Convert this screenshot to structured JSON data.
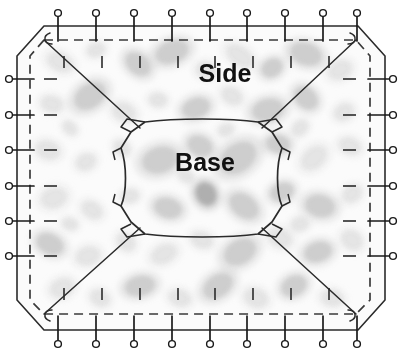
{
  "diagram": {
    "labels": {
      "side": "Side",
      "base": "Base"
    },
    "colors": {
      "outline": "#2b2b2b",
      "dashed_seam": "#3a3a3a",
      "pin_stroke": "#1a1a1a",
      "pin_fill": "#ffffff",
      "tick": "#2b2b2b",
      "fabric_base": "#fbfbfb",
      "fabric_blob_light": "#e2e2e2",
      "fabric_blob_mid": "#c9c9c9",
      "fabric_blob_dark": "#a8a8a8",
      "text": "#111111",
      "background": "#ffffff"
    },
    "geometry": {
      "outline_points": "44,26 358,26 385,56 385,300 358,330 44,330 17,300 17,56",
      "seam_points": "44,40 356,40 370,56 370,300 356,314 44,314 30,300 30,56",
      "base_path": "M145,122 C175,118 230,118 258,122 L272,132 L282,148 C276,165 276,192 282,206 L272,222 L258,234 C230,238 175,238 145,234 L131,222 L121,206 C127,192 127,165 121,148 L131,132 Z",
      "dart_lines": [
        "44,40 140,128",
        "356,40 262,128",
        "44,314 140,228",
        "356,314 262,228"
      ]
    },
    "pins": {
      "top": {
        "count": 9,
        "orientation": "vertical-down",
        "head_radius": 3.4,
        "y_head": 13,
        "y_tip": 41,
        "x_positions": [
          58,
          96,
          134,
          172,
          210,
          247,
          285,
          323,
          357
        ]
      },
      "bottom": {
        "count": 9,
        "orientation": "vertical-up",
        "head_radius": 3.4,
        "y_head": 344,
        "y_tip": 316,
        "x_positions": [
          58,
          96,
          134,
          172,
          210,
          247,
          285,
          323,
          357
        ]
      },
      "left": {
        "count": 6,
        "orientation": "horizontal-right",
        "head_radius": 3.4,
        "x_head": 9,
        "x_tip": 34,
        "y_positions": [
          79,
          115,
          150,
          186,
          221,
          256
        ]
      },
      "right": {
        "count": 6,
        "orientation": "horizontal-left",
        "head_radius": 3.4,
        "x_head": 393,
        "x_tip": 368,
        "y_positions": [
          79,
          115,
          150,
          186,
          221,
          256
        ]
      }
    },
    "ticks": {
      "top": {
        "count": 8,
        "x_positions": [
          64,
          102,
          140,
          178,
          215,
          253,
          291,
          329
        ],
        "y_start": 56,
        "y_end": 68
      },
      "bottom": {
        "count": 8,
        "x_positions": [
          64,
          102,
          140,
          178,
          215,
          253,
          291,
          329
        ],
        "y_start": 288,
        "y_end": 300
      },
      "left": {
        "count": 6,
        "y_positions": [
          79,
          115,
          150,
          186,
          221,
          256
        ],
        "x_start": 44,
        "x_end": 57
      },
      "right": {
        "count": 6,
        "y_positions": [
          79,
          115,
          150,
          186,
          221,
          256
        ],
        "x_start": 343,
        "x_end": 356
      }
    },
    "fabric_blobs": [
      {
        "cx": 60,
        "cy": 62,
        "rx": 13,
        "ry": 9,
        "rot": 24,
        "tone": "light"
      },
      {
        "cx": 96,
        "cy": 50,
        "rx": 9,
        "ry": 7,
        "rot": -15,
        "tone": "light"
      },
      {
        "cx": 138,
        "cy": 64,
        "rx": 14,
        "ry": 10,
        "rot": 40,
        "tone": "mid"
      },
      {
        "cx": 172,
        "cy": 52,
        "rx": 17,
        "ry": 11,
        "rot": -20,
        "tone": "mid"
      },
      {
        "cx": 206,
        "cy": 70,
        "rx": 10,
        "ry": 8,
        "rot": 10,
        "tone": "light"
      },
      {
        "cx": 240,
        "cy": 56,
        "rx": 15,
        "ry": 9,
        "rot": 35,
        "tone": "light"
      },
      {
        "cx": 272,
        "cy": 68,
        "rx": 11,
        "ry": 9,
        "rot": -30,
        "tone": "mid"
      },
      {
        "cx": 306,
        "cy": 54,
        "rx": 16,
        "ry": 11,
        "rot": 18,
        "tone": "mid"
      },
      {
        "cx": 340,
        "cy": 70,
        "rx": 12,
        "ry": 9,
        "rot": -25,
        "tone": "light"
      },
      {
        "cx": 52,
        "cy": 104,
        "rx": 11,
        "ry": 8,
        "rot": 12,
        "tone": "light"
      },
      {
        "cx": 90,
        "cy": 96,
        "rx": 17,
        "ry": 12,
        "rot": -35,
        "tone": "mid"
      },
      {
        "cx": 124,
        "cy": 112,
        "rx": 12,
        "ry": 9,
        "rot": 22,
        "tone": "light"
      },
      {
        "cx": 158,
        "cy": 100,
        "rx": 9,
        "ry": 7,
        "rot": 5,
        "tone": "light"
      },
      {
        "cx": 196,
        "cy": 108,
        "rx": 14,
        "ry": 10,
        "rot": -18,
        "tone": "mid"
      },
      {
        "cx": 232,
        "cy": 96,
        "rx": 11,
        "ry": 8,
        "rot": 30,
        "tone": "light"
      },
      {
        "cx": 268,
        "cy": 110,
        "rx": 16,
        "ry": 11,
        "rot": -12,
        "tone": "mid"
      },
      {
        "cx": 306,
        "cy": 98,
        "rx": 13,
        "ry": 10,
        "rot": 42,
        "tone": "mid"
      },
      {
        "cx": 344,
        "cy": 112,
        "rx": 10,
        "ry": 8,
        "rot": -28,
        "tone": "light"
      },
      {
        "cx": 48,
        "cy": 150,
        "rx": 12,
        "ry": 9,
        "rot": 16,
        "tone": "light"
      },
      {
        "cx": 86,
        "cy": 162,
        "rx": 10,
        "ry": 8,
        "rot": -22,
        "tone": "light"
      },
      {
        "cx": 122,
        "cy": 148,
        "rx": 9,
        "ry": 7,
        "rot": 38,
        "tone": "light"
      },
      {
        "cx": 160,
        "cy": 160,
        "rx": 18,
        "ry": 13,
        "rot": -15,
        "tone": "mid"
      },
      {
        "cx": 200,
        "cy": 146,
        "rx": 13,
        "ry": 10,
        "rot": 25,
        "tone": "mid"
      },
      {
        "cx": 238,
        "cy": 158,
        "rx": 20,
        "ry": 14,
        "rot": -35,
        "tone": "mid"
      },
      {
        "cx": 278,
        "cy": 144,
        "rx": 12,
        "ry": 9,
        "rot": 8,
        "tone": "mid"
      },
      {
        "cx": 314,
        "cy": 158,
        "rx": 14,
        "ry": 10,
        "rot": -40,
        "tone": "light"
      },
      {
        "cx": 350,
        "cy": 146,
        "rx": 11,
        "ry": 8,
        "rot": 20,
        "tone": "light"
      },
      {
        "cx": 54,
        "cy": 198,
        "rx": 13,
        "ry": 10,
        "rot": -18,
        "tone": "light"
      },
      {
        "cx": 92,
        "cy": 210,
        "rx": 11,
        "ry": 8,
        "rot": 32,
        "tone": "light"
      },
      {
        "cx": 130,
        "cy": 196,
        "rx": 9,
        "ry": 7,
        "rot": -10,
        "tone": "light"
      },
      {
        "cx": 168,
        "cy": 208,
        "rx": 14,
        "ry": 10,
        "rot": 15,
        "tone": "mid"
      },
      {
        "cx": 206,
        "cy": 194,
        "rx": 10,
        "ry": 12,
        "rot": -28,
        "tone": "dark"
      },
      {
        "cx": 244,
        "cy": 206,
        "rx": 16,
        "ry": 11,
        "rot": 36,
        "tone": "mid"
      },
      {
        "cx": 282,
        "cy": 192,
        "rx": 12,
        "ry": 9,
        "rot": -20,
        "tone": "mid"
      },
      {
        "cx": 320,
        "cy": 206,
        "rx": 15,
        "ry": 11,
        "rot": 12,
        "tone": "mid"
      },
      {
        "cx": 352,
        "cy": 194,
        "rx": 10,
        "ry": 8,
        "rot": -32,
        "tone": "light"
      },
      {
        "cx": 50,
        "cy": 244,
        "rx": 14,
        "ry": 10,
        "rot": 26,
        "tone": "mid"
      },
      {
        "cx": 88,
        "cy": 256,
        "rx": 12,
        "ry": 9,
        "rot": -14,
        "tone": "light"
      },
      {
        "cx": 126,
        "cy": 242,
        "rx": 10,
        "ry": 8,
        "rot": 40,
        "tone": "light"
      },
      {
        "cx": 164,
        "cy": 254,
        "rx": 13,
        "ry": 9,
        "rot": -24,
        "tone": "light"
      },
      {
        "cx": 202,
        "cy": 240,
        "rx": 11,
        "ry": 8,
        "rot": 18,
        "tone": "light"
      },
      {
        "cx": 240,
        "cy": 252,
        "rx": 17,
        "ry": 12,
        "rot": -30,
        "tone": "mid"
      },
      {
        "cx": 280,
        "cy": 238,
        "rx": 12,
        "ry": 9,
        "rot": 22,
        "tone": "light"
      },
      {
        "cx": 318,
        "cy": 252,
        "rx": 14,
        "ry": 10,
        "rot": -16,
        "tone": "mid"
      },
      {
        "cx": 352,
        "cy": 240,
        "rx": 11,
        "ry": 9,
        "rot": 34,
        "tone": "light"
      },
      {
        "cx": 62,
        "cy": 288,
        "rx": 12,
        "ry": 9,
        "rot": -20,
        "tone": "light"
      },
      {
        "cx": 100,
        "cy": 298,
        "rx": 10,
        "ry": 8,
        "rot": 28,
        "tone": "light"
      },
      {
        "cx": 140,
        "cy": 286,
        "rx": 15,
        "ry": 10,
        "rot": -12,
        "tone": "mid"
      },
      {
        "cx": 180,
        "cy": 298,
        "rx": 11,
        "ry": 8,
        "rot": 16,
        "tone": "light"
      },
      {
        "cx": 218,
        "cy": 286,
        "rx": 16,
        "ry": 11,
        "rot": -34,
        "tone": "mid"
      },
      {
        "cx": 256,
        "cy": 298,
        "rx": 12,
        "ry": 9,
        "rot": 20,
        "tone": "light"
      },
      {
        "cx": 294,
        "cy": 286,
        "rx": 13,
        "ry": 10,
        "rot": -26,
        "tone": "mid"
      },
      {
        "cx": 332,
        "cy": 298,
        "rx": 11,
        "ry": 8,
        "rot": 10,
        "tone": "light"
      },
      {
        "cx": 70,
        "cy": 128,
        "rx": 8,
        "ry": 6,
        "rot": 45,
        "tone": "light"
      },
      {
        "cx": 300,
        "cy": 128,
        "rx": 9,
        "ry": 7,
        "rot": -45,
        "tone": "light"
      },
      {
        "cx": 70,
        "cy": 224,
        "rx": 8,
        "ry": 6,
        "rot": 15,
        "tone": "light"
      },
      {
        "cx": 300,
        "cy": 224,
        "rx": 9,
        "ry": 7,
        "rot": -15,
        "tone": "light"
      },
      {
        "cx": 186,
        "cy": 176,
        "rx": 9,
        "ry": 6,
        "rot": 30,
        "tone": "light"
      },
      {
        "cx": 226,
        "cy": 130,
        "rx": 8,
        "ry": 6,
        "rot": -20,
        "tone": "light"
      }
    ]
  }
}
